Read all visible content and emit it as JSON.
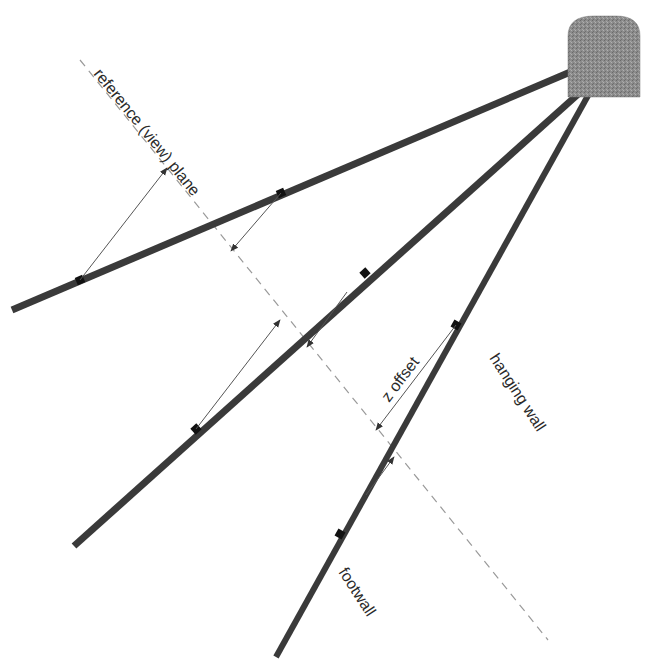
{
  "diagram": {
    "labels": {
      "reference_plane": "reference (view) plane",
      "z_offset": "z offset",
      "hanging_wall": "hanging wall",
      "footwall": "footwall"
    },
    "elements": {
      "collar": "drill collar / underground excavation",
      "drillholes": [
        "upper drillhole",
        "middle drillhole",
        "lower drillhole"
      ],
      "offset_arrows": 6
    },
    "colors": {
      "drillhole": "#3a3a3a",
      "collar": "#8a8a8a",
      "plane": "#9a9a9a",
      "arrow": "#555555"
    }
  }
}
